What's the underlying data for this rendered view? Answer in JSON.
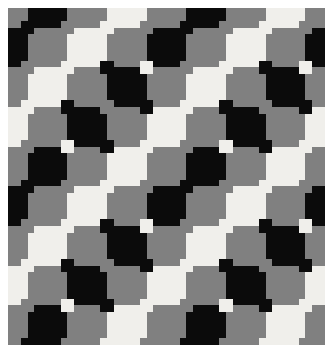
{
  "image": {
    "title": "Geometric Cross Tiling Pattern",
    "kind": "decorative-tiling",
    "width": 333,
    "height": 353,
    "background_color": "#ffffff",
    "border": {
      "left": 8,
      "top": 8,
      "right": 8,
      "bottom": 8,
      "color": "#ffffff"
    }
  },
  "pattern": {
    "name": "interlocking-greek-cross-tiling",
    "frame": {
      "x": 8,
      "y": 8,
      "width": 317,
      "height": 337
    },
    "cell_size": 39.625,
    "columns": 8,
    "rows": 8.5,
    "arm_ratio": 0.3333,
    "palette": {
      "black": "#0b0b0b",
      "gray": "#808080",
      "white": "#f0efeb"
    },
    "color_keys": [
      "black",
      "gray",
      "white"
    ],
    "color_grid": [
      [
        "black",
        "gray",
        "white",
        "gray",
        "black",
        "gray",
        "white",
        "gray",
        "black"
      ],
      [
        "gray",
        "white",
        "black",
        "white",
        "gray",
        "white",
        "black",
        "white",
        "gray"
      ],
      [
        "white",
        "black",
        "gray",
        "black",
        "white",
        "black",
        "gray",
        "black",
        "white"
      ],
      [
        "gray",
        "white",
        "black",
        "white",
        "gray",
        "white",
        "black",
        "white",
        "gray"
      ],
      [
        "black",
        "gray",
        "white",
        "gray",
        "black",
        "gray",
        "white",
        "gray",
        "black"
      ],
      [
        "gray",
        "white",
        "black",
        "white",
        "gray",
        "white",
        "black",
        "white",
        "gray"
      ],
      [
        "white",
        "black",
        "gray",
        "black",
        "white",
        "black",
        "gray",
        "black",
        "white"
      ],
      [
        "gray",
        "white",
        "black",
        "white",
        "gray",
        "white",
        "black",
        "white",
        "gray"
      ],
      [
        "black",
        "gray",
        "white",
        "gray",
        "black",
        "gray",
        "white",
        "gray",
        "black"
      ]
    ],
    "offset_grid": [
      [
        "gray",
        "black",
        "gray",
        "white",
        "gray",
        "black",
        "gray",
        "white",
        "gray"
      ],
      [
        "black",
        "gray",
        "white",
        "gray",
        "black",
        "gray",
        "white",
        "gray",
        "black"
      ],
      [
        "gray",
        "white",
        "gray",
        "black",
        "gray",
        "white",
        "gray",
        "black",
        "gray"
      ],
      [
        "white",
        "gray",
        "black",
        "gray",
        "white",
        "gray",
        "black",
        "gray",
        "white"
      ],
      [
        "gray",
        "black",
        "gray",
        "white",
        "gray",
        "black",
        "gray",
        "white",
        "gray"
      ],
      [
        "black",
        "gray",
        "white",
        "gray",
        "black",
        "gray",
        "white",
        "gray",
        "black"
      ],
      [
        "gray",
        "white",
        "gray",
        "black",
        "gray",
        "white",
        "gray",
        "black",
        "gray"
      ],
      [
        "white",
        "gray",
        "black",
        "gray",
        "white",
        "gray",
        "black",
        "gray",
        "white"
      ],
      [
        "gray",
        "black",
        "gray",
        "white",
        "gray",
        "black",
        "gray",
        "white",
        "gray"
      ]
    ]
  }
}
